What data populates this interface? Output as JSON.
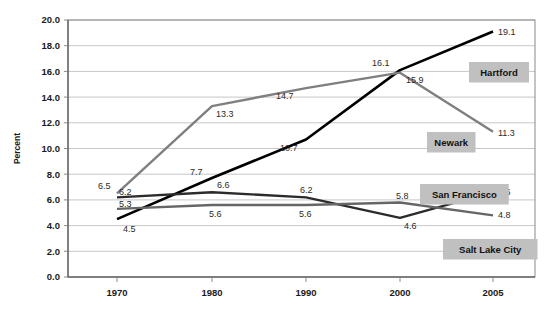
{
  "chart_data": {
    "type": "line",
    "title": "",
    "subtitle": "",
    "xlabel": "",
    "ylabel": "Percent",
    "x": [
      "1970",
      "1980",
      "1990",
      "2000",
      "2005"
    ],
    "categories": [
      "1970",
      "1980",
      "1990",
      "2000",
      "2005"
    ],
    "ylim": [
      0.0,
      20.0
    ],
    "ytick_step": 2.0,
    "ytick_labels": [
      "0.0",
      "2.0",
      "4.0",
      "6.0",
      "8.0",
      "10.0",
      "12.0",
      "14.0",
      "16.0",
      "18.0",
      "20.0"
    ],
    "ytick_values": [
      0.0,
      2.0,
      4.0,
      6.0,
      8.0,
      10.0,
      12.0,
      14.0,
      16.0,
      18.0,
      20.0
    ],
    "grid": true,
    "grid_axis": "y",
    "legend_position": "inline-plot-labels",
    "series": [
      {
        "name": "Hartford",
        "color": "#000000",
        "stroke_width": 2.6,
        "values": [
          4.5,
          7.7,
          10.7,
          16.1,
          19.1
        ],
        "point_labels": [
          "4.5",
          "7.7",
          "10.7",
          "16.1",
          "19.1"
        ]
      },
      {
        "name": "Newark",
        "color": "#7f7f7f",
        "stroke_width": 2.4,
        "values": [
          6.5,
          13.3,
          14.7,
          15.9,
          11.3
        ],
        "point_labels": [
          "6.5",
          "13.3",
          "14.7",
          "15.9",
          "11.3"
        ]
      },
      {
        "name": "San Francisco",
        "color": "#2b2b2b",
        "stroke_width": 2.4,
        "values": [
          6.2,
          6.6,
          6.2,
          4.6,
          6.6
        ],
        "point_labels": [
          "6.2",
          "6.6",
          "6.2",
          "4.6",
          "6.6"
        ]
      },
      {
        "name": "Salt Lake City",
        "color": "#666666",
        "stroke_width": 2.4,
        "values": [
          5.3,
          5.6,
          5.6,
          5.8,
          4.8
        ],
        "point_labels": [
          "5.3",
          "5.6",
          "5.6",
          "5.8",
          "4.8"
        ]
      }
    ],
    "annotations": [
      {
        "text": "4.5",
        "x": 1970,
        "y": 4.5,
        "dx": 6,
        "dy": 13,
        "name": "hartford-1970"
      },
      {
        "text": "7.7",
        "x": 1980,
        "y": 7.7,
        "dx": -22,
        "dy": -3,
        "name": "hartford-1980"
      },
      {
        "text": "10.7",
        "x": 1990,
        "y": 10.7,
        "dx": -26,
        "dy": 11,
        "name": "hartford-1990"
      },
      {
        "text": "16.1",
        "x": 2000,
        "y": 16.1,
        "dx": -28,
        "dy": -4,
        "name": "hartford-2000"
      },
      {
        "text": "19.1",
        "x": 2005,
        "y": 19.1,
        "dx": 5,
        "dy": 3,
        "name": "hartford-2005"
      },
      {
        "text": "6.5",
        "x": 1970,
        "y": 6.5,
        "dx": -19,
        "dy": -4,
        "name": "newark-1970"
      },
      {
        "text": "13.3",
        "x": 1980,
        "y": 13.3,
        "dx": 4,
        "dy": 11,
        "name": "newark-1980"
      },
      {
        "text": "14.7",
        "x": 1990,
        "y": 14.7,
        "dx": -30,
        "dy": 11,
        "name": "newark-1990"
      },
      {
        "text": "15.9",
        "x": 2000,
        "y": 15.9,
        "dx": 6,
        "dy": 10,
        "name": "newark-2000"
      },
      {
        "text": "11.3",
        "x": 2005,
        "y": 11.3,
        "dx": 5,
        "dy": 4,
        "name": "newark-2005"
      },
      {
        "text": "6.2",
        "x": 1970,
        "y": 6.2,
        "dx": 2,
        "dy": -2,
        "name": "sanfrancisco-1970"
      },
      {
        "text": "6.6",
        "x": 1980,
        "y": 6.6,
        "dx": 5,
        "dy": -4,
        "name": "sanfrancisco-1980"
      },
      {
        "text": "6.2",
        "x": 1990,
        "y": 6.2,
        "dx": -6,
        "dy": -4,
        "name": "sanfrancisco-1990"
      },
      {
        "text": "4.6",
        "x": 2000,
        "y": 4.6,
        "dx": 4,
        "dy": 11,
        "name": "sanfrancisco-2000"
      },
      {
        "text": "6.6",
        "x": 2005,
        "y": 6.6,
        "dx": 5,
        "dy": 3,
        "name": "sanfrancisco-2005"
      },
      {
        "text": "5.3",
        "x": 1970,
        "y": 5.3,
        "dx": 2,
        "dy": -2,
        "name": "saltlakecity-1970"
      },
      {
        "text": "5.6",
        "x": 1980,
        "y": 5.6,
        "dx": -3,
        "dy": 12,
        "name": "saltlakecity-1980"
      },
      {
        "text": "5.6",
        "x": 1990,
        "y": 5.6,
        "dx": -7,
        "dy": 12,
        "name": "saltlakecity-1990"
      },
      {
        "text": "5.8",
        "x": 2000,
        "y": 5.8,
        "dx": -4,
        "dy": -3,
        "name": "saltlakecity-2000"
      },
      {
        "text": "4.8",
        "x": 2005,
        "y": 4.8,
        "dx": 5,
        "dy": 3,
        "name": "saltlakecity-2005"
      }
    ],
    "series_labels": [
      {
        "text": "Hartford",
        "px": 469,
        "py": 62,
        "name": "hartford"
      },
      {
        "text": "Newark",
        "px": 427,
        "py": 132,
        "name": "newark"
      },
      {
        "text": "San Francisco",
        "px": 420,
        "py": 184,
        "name": "san-francisco"
      },
      {
        "text": "Salt Lake City",
        "px": 443,
        "py": 239,
        "name": "salt-lake-city"
      }
    ]
  },
  "colors": {
    "hartford": "#000000",
    "newark": "#7f7f7f",
    "san_francisco": "#2b2b2b",
    "salt_lake_city": "#666666",
    "gridline": "#b9b9b9",
    "label_box": "#c0c0c0",
    "background": "#ffffff"
  }
}
